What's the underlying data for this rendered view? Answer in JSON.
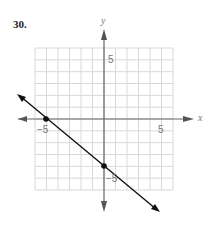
{
  "problem_number": "30.",
  "chart_data": {
    "type": "line",
    "title": "",
    "xlabel": "x",
    "ylabel": "y",
    "xlim": [
      -6,
      6
    ],
    "ylim": [
      -6,
      6
    ],
    "grid": true,
    "tick_labels": {
      "x": [
        "-5",
        "5"
      ],
      "y": [
        "5",
        "-5"
      ]
    },
    "series": [
      {
        "name": "line",
        "equation": "y = -4/5 x - 4",
        "points": [
          {
            "x": -5,
            "y": 0
          },
          {
            "x": 0,
            "y": -4
          }
        ]
      }
    ],
    "marked_points": [
      {
        "x": -5,
        "y": 0
      },
      {
        "x": 0,
        "y": -4
      }
    ]
  },
  "labels": {
    "x_axis": "x",
    "y_axis": "y",
    "x_neg5": "−5",
    "x_pos5": "5",
    "y_pos5": "5",
    "y_neg5": "−5"
  }
}
